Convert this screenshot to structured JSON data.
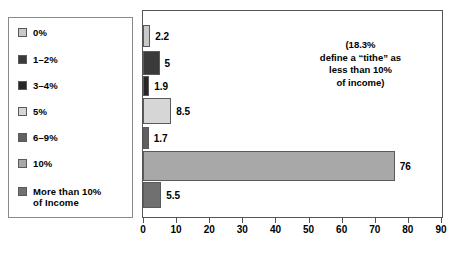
{
  "legend": {
    "items": [
      {
        "label": "0%",
        "color": "#c9c9c9"
      },
      {
        "label": "1–2%",
        "color": "#3a3a3a"
      },
      {
        "label": "3–4%",
        "color": "#262626"
      },
      {
        "label": "5%",
        "color": "#d6d6d6"
      },
      {
        "label": "6–9%",
        "color": "#606060"
      },
      {
        "label": "10%",
        "color": "#a8a8a8"
      },
      {
        "label": "More than 10%\nof Income",
        "color": "#707070"
      }
    ]
  },
  "annotation": {
    "text": "(18.3%\ndefine a “tithe” as\nless than 10%\nof income)"
  },
  "chart_data": {
    "type": "bar",
    "orientation": "horizontal",
    "title": "",
    "xlabel": "",
    "ylabel": "",
    "xlim": [
      0,
      90
    ],
    "xticks": [
      0,
      10,
      20,
      30,
      40,
      50,
      60,
      70,
      80,
      90
    ],
    "xtick_labels": [
      "0",
      "10",
      "20",
      "30",
      "40",
      "50",
      "60",
      "70",
      "80",
      "90"
    ],
    "grid": false,
    "legend_position": "left-outside",
    "categories": [
      "0%",
      "1–2%",
      "3–4%",
      "5%",
      "6–9%",
      "10%",
      "More than 10% of Income"
    ],
    "values": [
      2.2,
      5,
      1.9,
      8.5,
      1.7,
      76,
      5.5
    ],
    "value_labels": [
      "2.2",
      "5",
      "1.9",
      "8.5",
      "1.7",
      "76",
      "5.5"
    ],
    "colors": [
      "#c9c9c9",
      "#3a3a3a",
      "#262626",
      "#d6d6d6",
      "#606060",
      "#a8a8a8",
      "#707070"
    ]
  }
}
